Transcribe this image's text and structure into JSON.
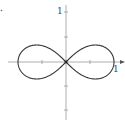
{
  "chart_data": {
    "type": "line",
    "title": "",
    "xlabel": "",
    "ylabel": "",
    "series": [
      {
        "name": "lemniscate",
        "equation": "r^2 = cos(2θ)",
        "x_extent": [
          -1,
          1
        ],
        "y_extent": [
          -0.354,
          0.354
        ]
      }
    ],
    "xlim": [
      -1.15,
      1.2
    ],
    "ylim": [
      -1.1,
      1.15
    ],
    "x_ticks": [
      -1,
      -0.5,
      0.5,
      1
    ],
    "y_ticks": [
      -1,
      -0.5,
      0.5,
      1
    ],
    "tick_labels": {
      "x": [
        "1"
      ],
      "y": [
        "1"
      ]
    },
    "grid": false,
    "legend": false
  },
  "labels": {
    "x_one": "1",
    "y_one": "1"
  },
  "colors": {
    "curve": "#333333",
    "axis": "#999999"
  }
}
